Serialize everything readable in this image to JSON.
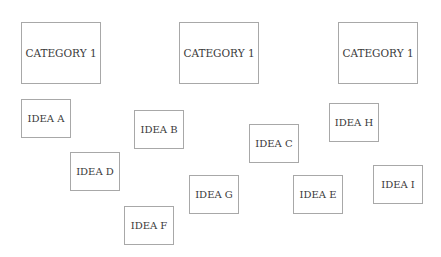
{
  "categories": [
    {
      "label": "CATEGORY 1",
      "x": 21,
      "y": 22,
      "w": 80,
      "h": 62
    },
    {
      "label": "CATEGORY 1",
      "x": 179,
      "y": 22,
      "w": 80,
      "h": 62
    },
    {
      "label": "CATEGORY 1",
      "x": 338,
      "y": 22,
      "w": 80,
      "h": 62
    }
  ],
  "ideas": [
    {
      "label": "IDEA A",
      "x": 21,
      "y": 99,
      "w": 50,
      "h": 39
    },
    {
      "label": "IDEA B",
      "x": 134,
      "y": 110,
      "w": 50,
      "h": 39
    },
    {
      "label": "IDEA C",
      "x": 249,
      "y": 124,
      "w": 50,
      "h": 39
    },
    {
      "label": "IDEA D",
      "x": 70,
      "y": 152,
      "w": 50,
      "h": 39
    },
    {
      "label": "IDEA E",
      "x": 293,
      "y": 175,
      "w": 50,
      "h": 39
    },
    {
      "label": "IDEA F",
      "x": 124,
      "y": 206,
      "w": 50,
      "h": 39
    },
    {
      "label": "IDEA G",
      "x": 189,
      "y": 175,
      "w": 50,
      "h": 39
    },
    {
      "label": "IDEA H",
      "x": 329,
      "y": 103,
      "w": 50,
      "h": 39
    },
    {
      "label": "IDEA I",
      "x": 373,
      "y": 165,
      "w": 50,
      "h": 39
    }
  ],
  "colors": {
    "border": "#a8a8a8",
    "text": "#3a3a3a",
    "background": "#ffffff"
  }
}
